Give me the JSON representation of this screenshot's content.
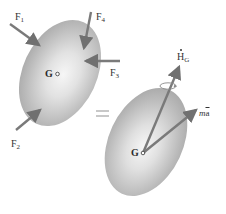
{
  "diagram": {
    "type": "free-body-diagram-equivalence",
    "equals_symbol": "=",
    "colors": {
      "body_light": "#f4f4f4",
      "body_dark": "#a8a8a8",
      "arrow": "#7a7a7a",
      "label": "#333333",
      "equals": "#c8c8c8"
    },
    "left_body": {
      "center_label": "G",
      "forces": [
        {
          "id": "F1",
          "label": "F",
          "subscript": "1"
        },
        {
          "id": "F2",
          "label": "F",
          "subscript": "2"
        },
        {
          "id": "F3",
          "label": "F",
          "subscript": "3"
        },
        {
          "id": "F4",
          "label": "F",
          "subscript": "4"
        }
      ]
    },
    "right_body": {
      "center_label": "G",
      "vectors": [
        {
          "id": "HG_dot",
          "label": "H",
          "subscript": "G",
          "modifier": "dot",
          "rotation_indicator": true
        },
        {
          "id": "ma_bar",
          "label_m": "m",
          "label_a": "a",
          "modifier": "bar"
        }
      ]
    }
  }
}
